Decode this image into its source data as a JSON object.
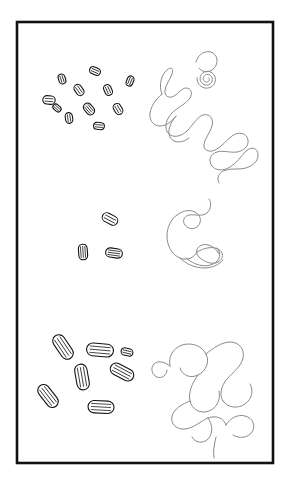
{
  "figure": {
    "title": "Rod-shaped particle clusters and tangled filament chains",
    "background_color": "#ffffff",
    "frame": {
      "name": "outer-frame",
      "x": 17,
      "y": 22,
      "width": 256,
      "height": 441,
      "stroke_color": "#111111",
      "stroke_width": 2.6,
      "fill": "#ffffff"
    },
    "style": {
      "particle_stroke_color": "#111111",
      "particle_fill_color": "#ffffff",
      "particle_stroke_width": 1.1,
      "particle_inner_line_width": 0.75,
      "filament_stroke_color": "#8a8a8a",
      "filament_stroke_width": 1.0,
      "filament_fill": "none"
    },
    "panels": [
      {
        "id": "row-top",
        "label": "Top row",
        "particle_cluster": {
          "name": "particle-cluster-top",
          "count": 11,
          "scale_label": "small",
          "particles": [
            {
              "cx": 62,
              "cy": 79,
              "rx": 5.0,
              "ry": 3.4,
              "angle": 72,
              "ribs": 2
            },
            {
              "cx": 95,
              "cy": 71,
              "rx": 5.6,
              "ry": 3.6,
              "angle": 24,
              "ribs": 2
            },
            {
              "cx": 130,
              "cy": 81,
              "rx": 5.2,
              "ry": 3.3,
              "angle": 112,
              "ribs": 2
            },
            {
              "cx": 79,
              "cy": 90,
              "rx": 6.0,
              "ry": 3.8,
              "angle": 55,
              "ribs": 2
            },
            {
              "cx": 108,
              "cy": 90,
              "rx": 5.6,
              "ry": 3.7,
              "angle": 66,
              "ribs": 2
            },
            {
              "cx": 49,
              "cy": 100,
              "rx": 6.2,
              "ry": 4.2,
              "angle": 4,
              "ribs": 2
            },
            {
              "cx": 89,
              "cy": 109,
              "rx": 6.4,
              "ry": 4.2,
              "angle": 50,
              "ribs": 3
            },
            {
              "cx": 118,
              "cy": 109,
              "rx": 5.8,
              "ry": 3.9,
              "angle": 60,
              "ribs": 2
            },
            {
              "cx": 69,
              "cy": 118,
              "rx": 5.4,
              "ry": 3.6,
              "angle": 82,
              "ribs": 2
            },
            {
              "cx": 99,
              "cy": 126,
              "rx": 5.4,
              "ry": 3.5,
              "angle": 6,
              "ribs": 2
            },
            {
              "cx": 57,
              "cy": 108,
              "rx": 4.4,
              "ry": 3.0,
              "angle": 40,
              "ribs": 2
            }
          ]
        },
        "filament": {
          "name": "filament-chain-top",
          "description": "large tangled chain with small spiral knot at upper right",
          "path": "M162,94 C158,85 162,74 167,70 C171,66 174,69 172,74 C170,80 166,84 165,90 C164,96 169,99 174,96 C179,93 182,88 186,88 C191,88 193,93 190,98 C186,104 178,107 172,113 C166,119 164,128 168,133 C173,139 182,136 187,131 C193,125 197,117 203,115 C210,113 214,119 212,126 C210,133 205,138 204,144 C203,150 209,153 215,150 C222,147 226,140 232,136 C239,131 247,133 248,140 C249,147 243,151 237,152 C230,153 223,150 217,152 C210,154 208,161 212,166 C216,171 224,171 230,167 C237,163 241,156 246,151 C252,146 258,148 258,155 C258,162 252,166 246,168 C239,170 232,168 226,170 C219,172 216,178 219,183",
          "path2": "M162,94 C156,99 151,106 150,113 C149,121 154,126 160,126 C167,126 172,121 176,116",
          "path3": "M176,116 C170,123 167,131 170,137 C174,144 183,143 189,138",
          "spiral": {
            "cx": 207,
            "cy": 79,
            "turns": 2.6,
            "r_start": 2,
            "r_end": 10,
            "angle_offset": -30
          },
          "tail_hook": "M196,62 C198,54 206,49 213,53 C219,57 218,66 212,70 C207,73 202,72 199,68"
        }
      },
      {
        "id": "row-middle",
        "label": "Middle row",
        "particle_cluster": {
          "name": "particle-cluster-middle",
          "count": 3,
          "scale_label": "small",
          "particles": [
            {
              "cx": 110,
              "cy": 219,
              "rx": 8.2,
              "ry": 4.6,
              "angle": 28,
              "ribs": 2
            },
            {
              "cx": 83,
              "cy": 252,
              "rx": 7.8,
              "ry": 4.4,
              "angle": 86,
              "ribs": 3
            },
            {
              "cx": 114,
              "cy": 253,
              "rx": 8.4,
              "ry": 4.6,
              "angle": 8,
              "ribs": 3
            }
          ]
        },
        "filament": {
          "name": "filament-chain-middle",
          "description": "short hooked filament with looped knot at lower right",
          "path": "M177,215 C171,219 167,227 167,236 C167,246 172,255 180,258 C187,261 194,258 197,252",
          "path2": "M177,215 C182,211 189,209 195,212 C201,215 202,222 198,226 C194,230 188,229 185,225 C182,221 184,216 189,215 C195,214 202,217 207,213 C211,209 212,203 209,199",
          "path3": "M197,252 C204,248 212,246 218,249 C224,252 224,259 218,262 C212,265 204,262 199,257 C195,253 196,247 202,245 C209,243 216,248 219,254",
          "path4": "M186,258 C194,265 205,268 213,264 C220,261 222,253 217,248",
          "tail": "M180,258 C186,264 195,268 204,268 C212,268 219,265 223,260"
        }
      },
      {
        "id": "row-bottom",
        "label": "Bottom row",
        "particle_cluster": {
          "name": "particle-cluster-bottom",
          "count": 7,
          "scale_label": "large",
          "particles": [
            {
              "cx": 63,
              "cy": 347,
              "rx": 13.5,
              "ry": 6.2,
              "angle": 56,
              "ribs": 3
            },
            {
              "cx": 100,
              "cy": 350,
              "rx": 13.5,
              "ry": 6.4,
              "angle": 5,
              "ribs": 3
            },
            {
              "cx": 82,
              "cy": 377,
              "rx": 13.0,
              "ry": 6.2,
              "angle": 80,
              "ribs": 3
            },
            {
              "cx": 122,
              "cy": 372,
              "rx": 12.5,
              "ry": 6.0,
              "angle": 28,
              "ribs": 3
            },
            {
              "cx": 48,
              "cy": 396,
              "rx": 13.0,
              "ry": 6.0,
              "angle": 52,
              "ribs": 3
            },
            {
              "cx": 101,
              "cy": 407,
              "rx": 13.0,
              "ry": 6.2,
              "angle": 3,
              "ribs": 3
            },
            {
              "cx": 127,
              "cy": 352,
              "rx": 6.0,
              "ry": 3.6,
              "angle": 14,
              "ribs": 2
            }
          ]
        },
        "filament": {
          "name": "filament-chain-bottom",
          "description": "large tangled chain with small hook at left and loop knot at lower right",
          "path": "M170,366 C168,357 173,348 182,345 C192,342 202,346 206,354 C210,362 206,371 198,375 C190,379 182,375 180,368",
          "path2": "M206,354 C213,348 222,342 230,342 C239,342 245,349 243,358 C241,367 233,372 227,379 C221,386 219,395 223,401",
          "path3": "M223,401 C228,408 238,409 245,404 C252,399 254,390 250,384",
          "path4": "M198,375 C192,383 188,393 190,401 C192,410 201,414 209,411 C217,408 221,399 219,391",
          "path5": "M190,401 C182,404 174,409 172,416 C170,424 177,430 185,429 C194,428 201,421 208,418 C216,415 224,418 226,425",
          "path6": "M226,425 C230,418 238,414 245,416 C253,418 256,426 252,432 C248,438 239,439 233,435",
          "path7": "M208,418 C213,425 213,434 208,439 C203,444 195,443 192,437",
          "hook": "M170,366 C165,362 158,360 154,364 C150,368 152,375 157,377 C162,379 167,375 167,370",
          "tail": "M216,437 C214,445 213,452 214,458"
        }
      }
    ]
  }
}
